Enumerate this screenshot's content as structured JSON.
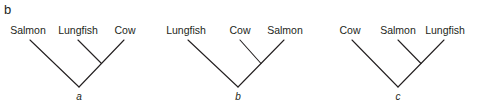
{
  "panel_label": "b",
  "trees": [
    {
      "id": "a",
      "label": "a",
      "leaves": [
        "Salmon",
        "Lungfish",
        "Cow"
      ],
      "topology": "(Salmon,(Lungfish,Cow))",
      "sister_pair": [
        "Lungfish",
        "Cow"
      ]
    },
    {
      "id": "b",
      "label": "b",
      "leaves": [
        "Lungfish",
        "Cow",
        "Salmon"
      ],
      "topology": "(Lungfish,(Cow,Salmon))",
      "sister_pair": [
        "Cow",
        "Salmon"
      ]
    },
    {
      "id": "c",
      "label": "c",
      "leaves": [
        "Cow",
        "Salmon",
        "Lungfish"
      ],
      "topology": "(Cow,(Salmon,Lungfish))",
      "sister_pair": [
        "Salmon",
        "Lungfish"
      ]
    }
  ],
  "colors": {
    "line": "#231f20",
    "text": "#231f20",
    "background": "#ffffff"
  }
}
